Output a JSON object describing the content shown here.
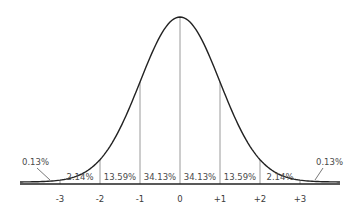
{
  "chart_data": {
    "type": "area",
    "title": "",
    "xlabel": "",
    "ylabel": "",
    "x_ticks": [
      "-3",
      "-2",
      "-1",
      "0",
      "+1",
      "+2",
      "+3"
    ],
    "x_tick_values": [
      -3,
      -2,
      -1,
      0,
      1,
      2,
      3
    ],
    "xlim": [
      -4,
      4
    ],
    "grid": false,
    "legend": "none",
    "bands": [
      {
        "range": [
          -4,
          -3
        ],
        "label": "0.13%",
        "value": 0.13
      },
      {
        "range": [
          -3,
          -2
        ],
        "label": "2.14%",
        "value": 2.14
      },
      {
        "range": [
          -2,
          -1
        ],
        "label": "13.59%",
        "value": 13.59
      },
      {
        "range": [
          -1,
          0
        ],
        "label": "34.13%",
        "value": 34.13
      },
      {
        "range": [
          0,
          1
        ],
        "label": "34.13%",
        "value": 34.13
      },
      {
        "range": [
          1,
          2
        ],
        "label": "13.59%",
        "value": 13.59
      },
      {
        "range": [
          2,
          3
        ],
        "label": "2.14%",
        "value": 2.14
      },
      {
        "range": [
          3,
          4
        ],
        "label": "0.13%",
        "value": 0.13
      }
    ]
  },
  "style": {
    "curve_color": "#222222",
    "divider_color": "#9a9a9a",
    "axis_color": "#222222",
    "text_color": "#4a4a4a"
  }
}
